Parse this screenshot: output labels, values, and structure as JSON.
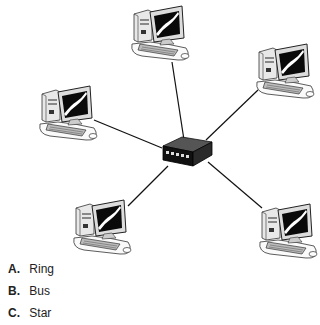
{
  "diagram": {
    "type": "network-topology",
    "hub": {
      "label": "switch",
      "x": 186,
      "y": 153
    },
    "nodes": [
      {
        "name": "computer-top",
        "x": 160,
        "y": 34,
        "link_end": [
          172,
          62
        ]
      },
      {
        "name": "computer-left",
        "x": 68,
        "y": 114,
        "link_end": [
          94,
          120
        ]
      },
      {
        "name": "computer-right",
        "x": 285,
        "y": 72,
        "link_end": [
          258,
          90
        ]
      },
      {
        "name": "computer-bottom-left",
        "x": 102,
        "y": 228,
        "link_end": [
          128,
          205
        ]
      },
      {
        "name": "computer-bottom-right",
        "x": 288,
        "y": 232,
        "link_end": [
          262,
          208
        ]
      }
    ],
    "colors": {
      "line": "#111111",
      "outline": "#222222",
      "screen": "#0a0a0a",
      "body": "#f2f2f2"
    }
  },
  "options": [
    {
      "letter": "A.",
      "text": "Ring"
    },
    {
      "letter": "B.",
      "text": "Bus"
    },
    {
      "letter": "C.",
      "text": "Star"
    }
  ]
}
